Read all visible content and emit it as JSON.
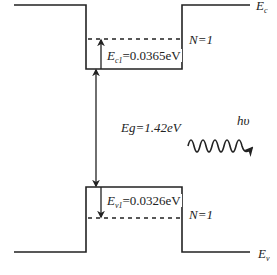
{
  "diagram": {
    "type": "quantum-well-band-diagram",
    "colors": {
      "line": "#222222",
      "background": "#ffffff"
    },
    "labels": {
      "conduction_band": {
        "main": "E",
        "sub": "c"
      },
      "valence_band": {
        "main": "E",
        "sub": "v"
      },
      "electron_level": {
        "main": "E",
        "sub": "c1",
        "value": "=0.0365eV"
      },
      "hole_level": {
        "main": "E",
        "sub": "v1",
        "value": "=0.0326eV"
      },
      "electron_state": "N=1",
      "hole_state": "N=1",
      "bandgap": "Eg=1.42eV",
      "photon": "hυ"
    },
    "geometry": {
      "cb_outer_y": 5,
      "cb_well_y": 69,
      "cb_level_y": 39,
      "vb_well_y": 187,
      "vb_level_y": 218,
      "vb_outer_y": 252,
      "well_left_x": 86,
      "well_right_x": 182,
      "outer_left_x": 14,
      "outer_right_x": 250
    }
  }
}
